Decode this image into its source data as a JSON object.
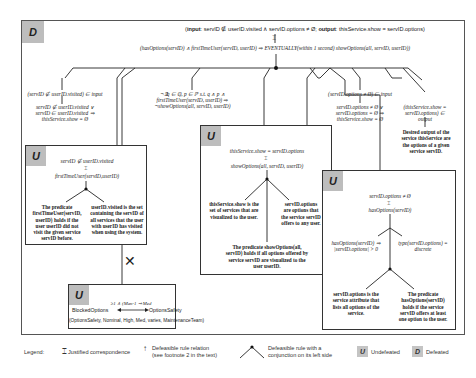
{
  "outer_box": {
    "tag": "D",
    "top_statement": {
      "prefix_bold": "input",
      "input_expr": ": servID ∉ userID.visited ∧ servID.options ≠ Ø; ",
      "output_bold": "output",
      "output_expr": ": thisService.show = servID.options)",
      "open_paren": "("
    },
    "main_rule": "(hasOptions(servID) ∧ firstTimeUser(servID, userID) ⇒ EVENTUALLY(within 1 second) showOptions(all, servID, userID))"
  },
  "left_branch": {
    "input_cond": "(servID ∉ userID.visited) ∈ input",
    "derived": [
      "servID ∉ userID.visited ∨",
      "servID ∈ userID.visited ⇒",
      "thisService.show = Ø"
    ]
  },
  "middle_branch": {
    "formula": [
      "¬∃q ∈ ℚ, p ∈ ℙ s.t. q ∧ p ∧",
      "firstTimeUser(servID, userID) ⇒",
      "¬showOptions(all, servID, userID)"
    ]
  },
  "right_branch": {
    "input_cond": "(servID.options ≠ Ø) ∈ input",
    "derived": [
      "servID.options ≠ Ø ∨",
      "servID.options = Ø ⇒",
      "thisService.show = Ø"
    ],
    "output_cond": [
      "(thisService.show =",
      "servID.options) ∈",
      "output"
    ],
    "desired_output": [
      "Desired output of the",
      "service thisService are",
      "the options of a given",
      "service servID."
    ]
  },
  "box_first_time": {
    "tag": "U",
    "top": "servID ∉ userID.visited",
    "predicate": "firstTimeUser(servID,userID)",
    "left_note": [
      "The predicate",
      "firstTimeUser(servID,",
      "userID) holds if the",
      "user userID did not",
      "visit the given service",
      "servID before."
    ],
    "right_note": [
      "userID.visited is the set",
      "containing the servID of",
      "all services that the user",
      "with userID has visited",
      "when using the system."
    ]
  },
  "box_show_options": {
    "tag": "U",
    "top": "thisService.show = servID.options",
    "predicate": "showOptions(all, servID, userID)",
    "left_note": [
      "thisService.show is the",
      "set of services that are",
      "visualized to the user."
    ],
    "right_note": [
      "servID.options",
      "are options that",
      "the service servID",
      "offers to any user."
    ],
    "bottom_note": [
      "The predicate showOptions(all,",
      "servID) holds if all options offered by",
      "service servID are visualized to the",
      "user userID."
    ]
  },
  "box_has_options": {
    "tag": "U",
    "top": "servID.options ≠ Ø",
    "predicate": "hasOptions(servID)",
    "left_formula": [
      "hasOptions(servID) ⇒",
      "|servID.options| > 0"
    ],
    "right_formula": [
      "type(servID.options) =",
      "discrete"
    ],
    "left_note": [
      "servID.options is the",
      "service attribute that",
      "lists all options of the",
      "service."
    ],
    "right_note": [
      "The predicate",
      "hasOptions(servID)",
      "holds if the service",
      "servID offers at least",
      "one option to the user."
    ]
  },
  "box_safety": {
    "tag": "U",
    "left_node": "BlockedOptions",
    "right_node": "OptionsSafety",
    "edge_label": "≥1 ∧ (Man-1 ⇒ Med",
    "tuple": "(OptionsSafety, Nominal, High, Med, varies, MaintenanceTeam)"
  },
  "legend": {
    "title": "Legend:",
    "items": [
      {
        "label": "Justified correspondence"
      },
      {
        "label": [
          "Defeasible rule relation",
          "(see footnote 2 in the text)"
        ]
      },
      {
        "label": [
          "Defeasible rule with a",
          "conjunction on its left side"
        ]
      },
      {
        "tag": "U",
        "label": "Undefeated"
      },
      {
        "tag": "D",
        "label": "Defeated"
      }
    ]
  },
  "colors": {
    "tag_bg": "#bdbdbd",
    "line": "#222222",
    "border": "#555555"
  }
}
